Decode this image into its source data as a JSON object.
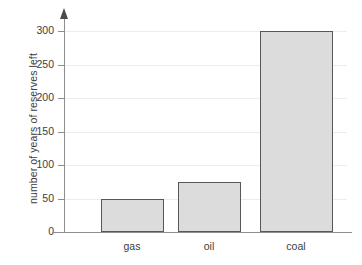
{
  "chart_data": {
    "type": "bar",
    "title": "",
    "subtitle": "",
    "xlabel": "",
    "ylabel": "number of years of reserves left",
    "categories": [
      "gas",
      "oil",
      "coal"
    ],
    "values": [
      50,
      75,
      300
    ],
    "series": [
      {
        "name": "reserves",
        "values": [
          50,
          75,
          300
        ]
      }
    ],
    "ylim": [
      0,
      300
    ],
    "ytick_labels": [
      "300",
      "250",
      "200",
      "150",
      "100",
      "50",
      "0"
    ],
    "ytick_values": [
      300,
      250,
      200,
      150,
      100,
      50,
      0
    ],
    "grid": true,
    "grid_axis": "y",
    "legend": false,
    "legend_position": "none",
    "annotations": [],
    "colors": {
      "bar_fill": "#dcdcdc",
      "bar_border": "#585858",
      "gridline": "#ececec",
      "axis": "#8e8e8e",
      "text": "#3c3c3c",
      "background": "#ffffff"
    },
    "y_axis_has_arrow": true
  }
}
